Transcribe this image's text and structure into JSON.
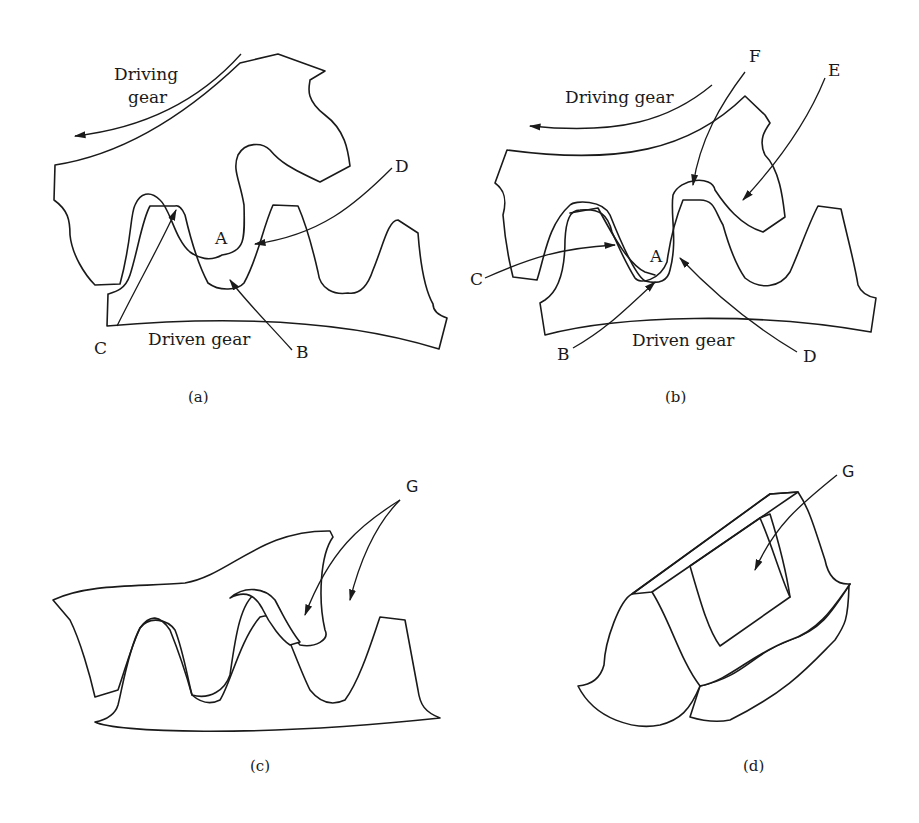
{
  "figure": {
    "panels": [
      {
        "id": "a",
        "caption": "(a)",
        "labels": {
          "driving_gear_line1": "Driving",
          "driving_gear_line2": "gear",
          "driven_gear": "Driven gear",
          "A": "A",
          "B": "B",
          "C": "C",
          "D": "D"
        }
      },
      {
        "id": "b",
        "caption": "(b)",
        "labels": {
          "driving_gear": "Driving gear",
          "driven_gear": "Driven gear",
          "A": "A",
          "B": "B",
          "C": "C",
          "D": "D",
          "E": "E",
          "F": "F"
        }
      },
      {
        "id": "c",
        "caption": "(c)",
        "labels": {
          "G": "G"
        }
      },
      {
        "id": "d",
        "caption": "(d)",
        "labels": {
          "G": "G"
        }
      }
    ],
    "colors": {
      "ink": "#1a1a1a",
      "background": "#ffffff"
    }
  }
}
